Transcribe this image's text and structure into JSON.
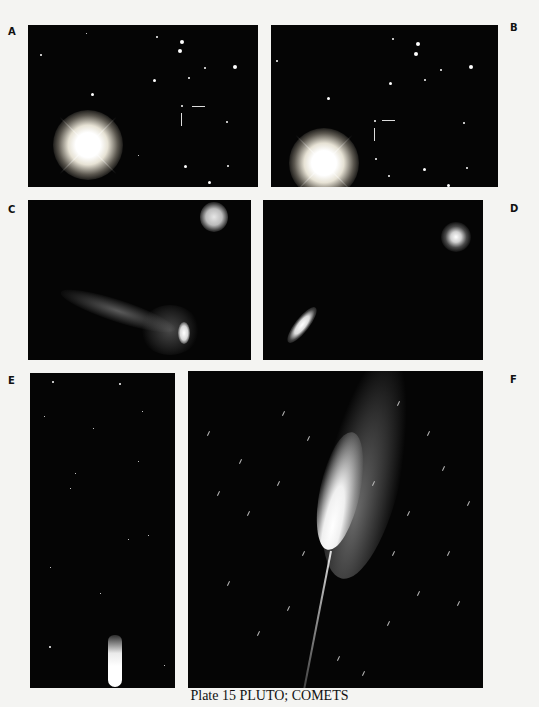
{
  "plate": {
    "caption": "Plate 15 PLUTO; COMETS",
    "panels": [
      {
        "id": "A",
        "label": "A",
        "subject": "star field with bright flared star and arrows marking Pluto"
      },
      {
        "id": "B",
        "label": "B",
        "subject": "same star field later, arrows marking Pluto's shifted position"
      },
      {
        "id": "C",
        "label": "C",
        "subject": "diffuse comet with tail and nearby fuzzy object"
      },
      {
        "id": "D",
        "label": "D",
        "subject": "compact elongated comet and fuzzy object"
      },
      {
        "id": "E",
        "label": "E",
        "subject": "star field with small comet near bottom"
      },
      {
        "id": "F",
        "label": "F",
        "subject": "bright comet with long tail and trailed stars"
      }
    ]
  },
  "colors": {
    "page": "#f4f4f2",
    "panel": "#050505",
    "text": "#111111"
  }
}
